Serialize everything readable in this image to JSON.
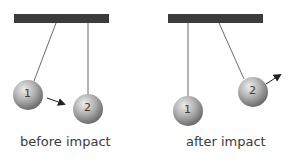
{
  "panels": [
    {
      "id": "before",
      "caption": "before impact",
      "balls": [
        {
          "label": "1"
        },
        {
          "label": "2"
        }
      ]
    },
    {
      "id": "after",
      "caption": "after impact",
      "balls": [
        {
          "label": "1"
        },
        {
          "label": "2"
        }
      ]
    }
  ],
  "colors": {
    "bar": "#3c3c3c",
    "string": "#6a6a6a",
    "ball_light": "#e6e6e6",
    "ball_dark": "#6e6e6e",
    "arrow": "#222222",
    "text": "#3a3a3a"
  }
}
